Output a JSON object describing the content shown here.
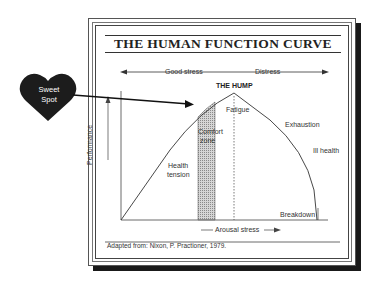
{
  "title": "THE HUMAN FUNCTION CURVE",
  "zones": {
    "good_stress": "Good stress",
    "distress": "Distress"
  },
  "labels": {
    "hump": "THE HUMP",
    "fatigue": "Fatigue",
    "comfort_zone_line1": "Comfort",
    "comfort_zone_line2": "zone",
    "exhaustion": "Exhaustion",
    "ill_health": "Ill health",
    "health_tension_line1": "Health",
    "health_tension_line2": "tension",
    "breakdown": "Breakdown"
  },
  "axes": {
    "y_label": "Performance",
    "x_label": "Arousal stress"
  },
  "caption": "Adapted from: Nixon, P. Practioner, 1979.",
  "callout": {
    "line1": "Sweet",
    "line2": "Spot",
    "color": "#1c1c1c"
  },
  "colors": {
    "line": "#333333",
    "shade": "#bdbdbd",
    "shadow": "#1a1a1a"
  }
}
